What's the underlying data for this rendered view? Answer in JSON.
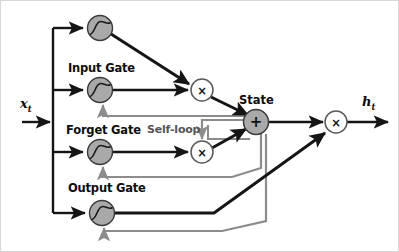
{
  "figure": {
    "background": "#ffffff"
  },
  "colors": {
    "line_dark": "#151515",
    "line_gray": "#8c8c8c",
    "sigmoid_fill": "#a9a9a9",
    "state_fill": "#a9a9a9",
    "mult_fill": "#ffffff",
    "text": "#0d0d0d",
    "text_gray": "#555555"
  },
  "labels": {
    "input_signal": "x",
    "input_signal_sub": "t",
    "output_signal": "h",
    "output_signal_sub": "t",
    "input_gate": "Input Gate",
    "forget_gate": "Forget Gate",
    "output_gate": "Output Gate",
    "state": "State",
    "self_loop": "Self-loop"
  },
  "nodes": [
    {
      "id": "sig-input-candidate",
      "kind": "sigmoid-unit",
      "label": "",
      "cx": 100,
      "cy": 28,
      "r": 12.5
    },
    {
      "id": "sig-input-gate",
      "kind": "sigmoid-unit",
      "label": "Input Gate",
      "cx": 100,
      "cy": 90,
      "r": 12.5
    },
    {
      "id": "sig-forget-gate",
      "kind": "sigmoid-unit",
      "label": "Forget Gate",
      "cx": 100,
      "cy": 152,
      "r": 12.5
    },
    {
      "id": "sig-output-gate",
      "kind": "sigmoid-unit",
      "label": "Output Gate",
      "cx": 102,
      "cy": 213,
      "r": 12.5
    },
    {
      "id": "mult-input",
      "kind": "multiply",
      "glyph": "×",
      "cx": 202,
      "cy": 90,
      "r": 11
    },
    {
      "id": "mult-forget",
      "kind": "multiply",
      "glyph": "×",
      "cx": 202,
      "cy": 152,
      "r": 11
    },
    {
      "id": "state-sum",
      "kind": "add",
      "glyph": "+",
      "label": "State",
      "cx": 256,
      "cy": 122,
      "r": 12.5
    },
    {
      "id": "mult-output",
      "kind": "multiply",
      "glyph": "×",
      "cx": 336,
      "cy": 122,
      "r": 11
    }
  ],
  "edges": [
    {
      "id": "x-in",
      "from": "input",
      "to": "bus",
      "style": "dark"
    },
    {
      "id": "bus-to-candidate",
      "from": "bus",
      "to": "sig-input-candidate",
      "style": "dark"
    },
    {
      "id": "bus-to-input-gate",
      "from": "bus",
      "to": "sig-input-gate",
      "style": "dark"
    },
    {
      "id": "bus-to-forget-gate",
      "from": "bus",
      "to": "sig-forget-gate",
      "style": "dark"
    },
    {
      "id": "bus-to-output-gate",
      "from": "bus",
      "to": "sig-output-gate",
      "style": "dark"
    },
    {
      "id": "candidate-to-mult-input",
      "from": "sig-input-candidate",
      "to": "mult-input",
      "style": "dark"
    },
    {
      "id": "input-gate-to-mult-input",
      "from": "sig-input-gate",
      "to": "mult-input",
      "style": "dark"
    },
    {
      "id": "mult-input-to-state",
      "from": "mult-input",
      "to": "state-sum",
      "style": "dark"
    },
    {
      "id": "forget-gate-to-mult-forget",
      "from": "sig-forget-gate",
      "to": "mult-forget",
      "style": "dark"
    },
    {
      "id": "mult-forget-to-state",
      "from": "mult-forget",
      "to": "state-sum",
      "style": "dark"
    },
    {
      "id": "state-self-loop",
      "from": "state-sum",
      "to": "mult-forget",
      "style": "gray"
    },
    {
      "id": "state-to-mult-output",
      "from": "state-sum",
      "to": "mult-output",
      "style": "dark"
    },
    {
      "id": "output-gate-to-mult-output",
      "from": "sig-output-gate",
      "to": "mult-output",
      "style": "dark"
    },
    {
      "id": "state-feedback-input-gate",
      "from": "state-sum",
      "to": "sig-input-gate",
      "style": "gray"
    },
    {
      "id": "state-feedback-forget-gate",
      "from": "state-sum",
      "to": "sig-forget-gate",
      "style": "gray"
    },
    {
      "id": "state-feedback-output-gate",
      "from": "state-sum",
      "to": "sig-output-gate",
      "style": "gray"
    },
    {
      "id": "mult-output-to-h",
      "from": "mult-output",
      "to": "output",
      "style": "dark"
    }
  ]
}
